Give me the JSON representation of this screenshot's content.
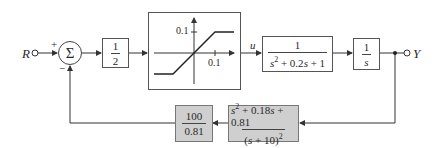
{
  "diagram": {
    "type": "control-system block diagram",
    "input": {
      "label": "R"
    },
    "output": {
      "label": "Y"
    },
    "summing_junction": {
      "symbol": "Σ",
      "plus_sign": "+",
      "minus_sign": "−"
    },
    "forward_path": [
      {
        "id": "gain_half",
        "numerator": "1",
        "denominator": "2"
      },
      {
        "id": "saturation",
        "type": "saturation nonlinearity",
        "y_tick": "0.1",
        "x_tick": "0.1"
      },
      {
        "id": "signal_u",
        "label": "u"
      },
      {
        "id": "plant",
        "numerator": "1",
        "denominator_parts": [
          "s",
          "2",
          " + 0.2",
          "s",
          " + 1"
        ]
      },
      {
        "id": "integrator",
        "numerator": "1",
        "denominator": "s"
      }
    ],
    "feedback_path": [
      {
        "id": "filter",
        "numerator_parts": [
          "s",
          "2",
          " + 0.18",
          "s",
          " + 0.81"
        ],
        "denominator_parts": [
          "(",
          "s",
          " + 10)",
          "2"
        ],
        "shaded": true
      },
      {
        "id": "feedback_gain",
        "numerator": "100",
        "denominator": "0.81",
        "shaded": true
      }
    ],
    "colors": {
      "line": "#333333",
      "shaded_block": "#cfcfcf",
      "block_border": "#555555"
    }
  }
}
